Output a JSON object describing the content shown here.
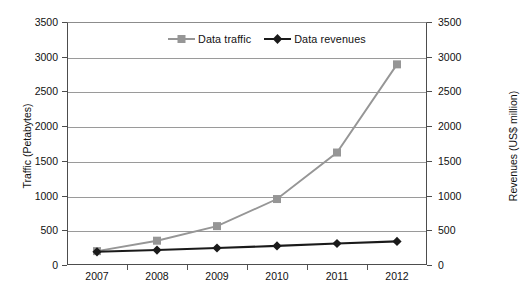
{
  "chart_data": {
    "type": "line",
    "title": "",
    "xlabel": "",
    "categories": [
      "2007",
      "2008",
      "2009",
      "2010",
      "2011",
      "2012"
    ],
    "series": [
      {
        "name": "Data traffic",
        "axis": "left",
        "color": "#969696",
        "marker": "square",
        "values": [
          200,
          350,
          560,
          950,
          1620,
          2890
        ]
      },
      {
        "name": "Data revenues",
        "axis": "right",
        "color": "#1a1a1a",
        "marker": "diamond",
        "values": [
          190,
          215,
          245,
          275,
          310,
          340
        ]
      }
    ],
    "axes": {
      "left": {
        "label": "Traffic (Petabytes)",
        "ticks": [
          "0",
          "500",
          "1000",
          "1500",
          "2000",
          "2500",
          "3000",
          "3500"
        ],
        "tick_values": [
          0,
          500,
          1000,
          1500,
          2000,
          2500,
          3000,
          3500
        ],
        "ylim": [
          0,
          3500
        ]
      },
      "right": {
        "label": "Revenues (US$ million)",
        "ticks": [
          "0",
          "500",
          "1000",
          "1500",
          "2000",
          "2500",
          "3000",
          "3500"
        ],
        "tick_values": [
          0,
          500,
          1000,
          1500,
          2000,
          2500,
          3000,
          3500
        ],
        "ylim": [
          0,
          3500
        ]
      }
    },
    "grid": true,
    "legend_position": "top-center-inside"
  }
}
